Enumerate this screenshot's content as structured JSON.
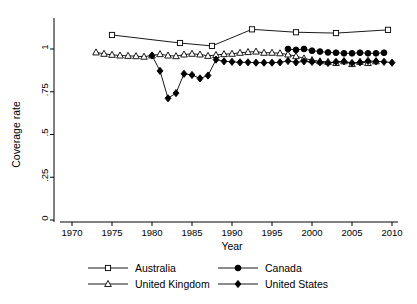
{
  "chart_data": {
    "type": "line",
    "title": "",
    "xlabel": "Year",
    "ylabel": "Coverage rate",
    "xlim": [
      1967.5,
      2012
    ],
    "ylim": [
      0,
      1.18
    ],
    "xticks": [
      1970,
      1975,
      1980,
      1985,
      1990,
      1995,
      2000,
      2005,
      2010
    ],
    "xticklabels": [
      "1970",
      "1975",
      "1980",
      "1985",
      "1990",
      "1995",
      "2000",
      "2005",
      "2010"
    ],
    "yticks": [
      0,
      0.25,
      0.5,
      0.75,
      1
    ],
    "yticklabels": [
      "0",
      ".25",
      ".5",
      ".75",
      "1"
    ],
    "grid": false,
    "legend_position": "bottom",
    "series": [
      {
        "name": "Australia",
        "marker": "open-square",
        "color": "#000000",
        "x": [
          1975,
          1983.5,
          1987.5,
          1992.5,
          1998,
          2003,
          2009.5
        ],
        "values": [
          1.082,
          1.035,
          1.018,
          1.115,
          1.098,
          1.093,
          1.112
        ]
      },
      {
        "name": "Canada",
        "marker": "filled-circle",
        "color": "#000000",
        "x": [
          1997,
          1998,
          1999,
          2000,
          2001,
          2002,
          2003,
          2004,
          2005,
          2006,
          2007,
          2008,
          2009
        ],
        "values": [
          1.0,
          0.995,
          1.0,
          0.99,
          0.985,
          0.98,
          0.978,
          0.975,
          0.975,
          0.978,
          0.975,
          0.975,
          0.978
        ]
      },
      {
        "name": "United Kingdom",
        "marker": "open-triangle",
        "color": "#000000",
        "x": [
          1973,
          1974,
          1975,
          1976,
          1977,
          1978,
          1979,
          1980,
          1981,
          1982,
          1983,
          1984,
          1985,
          1986,
          1987,
          1988,
          1989,
          1990,
          1991,
          1992,
          1993,
          1994,
          1995,
          1996,
          1997,
          1998,
          1999,
          2000,
          2001,
          2002,
          2003,
          2004,
          2005,
          2006,
          2007,
          2008
        ],
        "values": [
          0.98,
          0.972,
          0.966,
          0.962,
          0.96,
          0.958,
          0.955,
          0.962,
          0.97,
          0.962,
          0.958,
          0.968,
          0.972,
          0.968,
          0.96,
          0.965,
          0.97,
          0.972,
          0.978,
          0.982,
          0.985,
          0.978,
          0.978,
          0.975,
          0.968,
          0.958,
          0.945,
          0.935,
          0.928,
          0.925,
          0.918,
          0.928,
          0.912,
          0.925,
          0.918,
          0.928
        ]
      },
      {
        "name": "United States",
        "marker": "filled-diamond",
        "color": "#000000",
        "x": [
          1980,
          1981,
          1982,
          1983,
          1984,
          1985,
          1986,
          1987,
          1988,
          1989,
          1990,
          1991,
          1992,
          1993,
          1994,
          1995,
          1996,
          1997,
          1998,
          1999,
          2000,
          2001,
          2002,
          2003,
          2004,
          2005,
          2006,
          2007,
          2008,
          2009,
          2010
        ],
        "values": [
          0.962,
          0.872,
          0.712,
          0.742,
          0.855,
          0.848,
          0.828,
          0.845,
          0.938,
          0.928,
          0.925,
          0.922,
          0.922,
          0.92,
          0.92,
          0.92,
          0.922,
          0.93,
          0.922,
          0.928,
          0.925,
          0.922,
          0.918,
          0.925,
          0.928,
          0.918,
          0.922,
          0.93,
          0.928,
          0.925,
          0.92
        ]
      }
    ],
    "legend": [
      {
        "label": "Australia",
        "marker": "open-square"
      },
      {
        "label": "Canada",
        "marker": "filled-circle"
      },
      {
        "label": "United Kingdom",
        "marker": "open-triangle"
      },
      {
        "label": "United States",
        "marker": "filled-diamond"
      }
    ]
  }
}
